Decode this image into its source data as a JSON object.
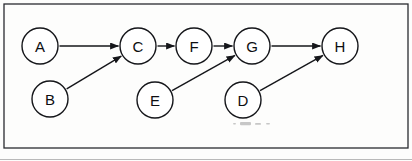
{
  "diagram": {
    "type": "directed-graph",
    "frame": {
      "x": 4,
      "y": 4,
      "width": 404,
      "height": 144
    },
    "node_radius": 18,
    "nodes": [
      {
        "id": "A",
        "label": "A",
        "cx": 40,
        "cy": 46
      },
      {
        "id": "B",
        "label": "B",
        "cx": 50,
        "cy": 99
      },
      {
        "id": "C",
        "label": "C",
        "cx": 138,
        "cy": 46
      },
      {
        "id": "D",
        "label": "D",
        "cx": 243,
        "cy": 100
      },
      {
        "id": "E",
        "label": "E",
        "cx": 155,
        "cy": 100
      },
      {
        "id": "F",
        "label": "F",
        "cx": 194,
        "cy": 46
      },
      {
        "id": "G",
        "label": "G",
        "cx": 252,
        "cy": 46
      },
      {
        "id": "H",
        "label": "H",
        "cx": 340,
        "cy": 46
      }
    ],
    "edges": [
      {
        "from": "A",
        "to": "C",
        "label": "A to C"
      },
      {
        "from": "B",
        "to": "C",
        "label": "B to C"
      },
      {
        "from": "C",
        "to": "F",
        "label": "C to F"
      },
      {
        "from": "F",
        "to": "G",
        "label": "F to G"
      },
      {
        "from": "E",
        "to": "G",
        "label": "E to G"
      },
      {
        "from": "G",
        "to": "H",
        "label": "G to H"
      },
      {
        "from": "D",
        "to": "H",
        "label": "D to H"
      }
    ],
    "colors": {
      "stroke": "#15161a",
      "node_fill": "#ffffff",
      "background": "#fdfdfc",
      "frame": "#2a2b30"
    },
    "artifact": {
      "name": "scan-smudge",
      "x": 232,
      "y": 122,
      "width": 42,
      "height": 4
    }
  }
}
